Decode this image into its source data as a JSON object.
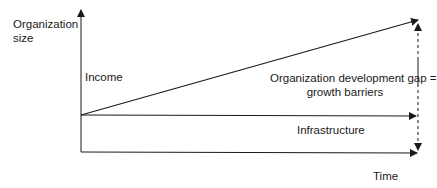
{
  "diagram": {
    "axis_labels": {
      "y": "Organization\nsize",
      "y_line1": "Organization",
      "y_line2": "size",
      "x": "Time"
    },
    "labels": {
      "income": "Income",
      "gap_line1": "Organization development gap =",
      "gap_line2": "growth barriers",
      "infrastructure": "Infrastructure"
    },
    "colors": {
      "line": "#1a1a1a",
      "background": "#ffffff"
    }
  }
}
